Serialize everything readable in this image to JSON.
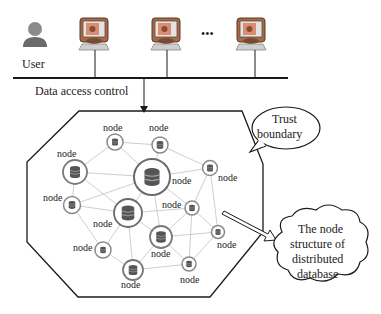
{
  "user": {
    "label": "User",
    "icon": "user-icon"
  },
  "terminals": {
    "count_visible": 3,
    "ellipsis": "•••",
    "icon": "monitor-icon"
  },
  "network": {
    "access_label": "Data access control"
  },
  "trust_boundary": {
    "line1": "Trust",
    "line2": "boundary"
  },
  "callout": {
    "line1": "The node",
    "line2": "structure of",
    "line3": "distributed",
    "line4": "database"
  },
  "nodes": [
    {
      "id": "A",
      "label": "node",
      "size": "small"
    },
    {
      "id": "B",
      "label": "node",
      "size": "small"
    },
    {
      "id": "C",
      "label": "node",
      "size": "medium"
    },
    {
      "id": "D",
      "label": "node",
      "size": "large"
    },
    {
      "id": "E",
      "label": "node",
      "size": "small"
    },
    {
      "id": "F",
      "label": "node",
      "size": "medium"
    },
    {
      "id": "G",
      "label": "node",
      "size": "small"
    },
    {
      "id": "H",
      "label": "node",
      "size": "small"
    },
    {
      "id": "I",
      "label": "node",
      "size": "medium"
    },
    {
      "id": "J",
      "label": "node",
      "size": "small"
    },
    {
      "id": "K",
      "label": "node",
      "size": "medium"
    },
    {
      "id": "L",
      "label": "node",
      "size": "small"
    },
    {
      "id": "M",
      "label": "node",
      "size": "small"
    }
  ],
  "colors": {
    "line": "#1a1a1a",
    "mesh": "#c8c8c8",
    "node_ring": "#8a8a8a",
    "db": "#4a4a4a",
    "monitor_body": "#b07a55",
    "monitor_screen": "#d98a6a",
    "user": "#7a7a7a"
  }
}
